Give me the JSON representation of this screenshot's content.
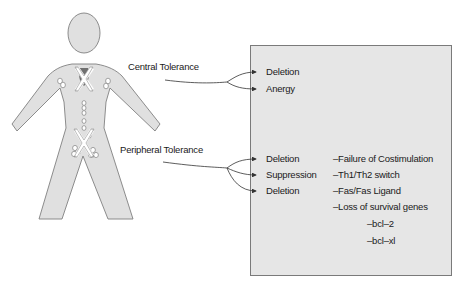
{
  "figure": {
    "body_color": "#e0e0e0",
    "outline_color": "#808080",
    "marker_color": "#ffffff"
  },
  "labels": {
    "central": "Central Tolerance",
    "peripheral": "Peripheral Tolerance"
  },
  "box": {
    "background": "#e6e6e6",
    "central_outcomes": [
      "Deletion",
      "Anergy"
    ],
    "peripheral_outcomes": [
      "Deletion",
      "Suppression",
      "Deletion"
    ],
    "mechanisms": [
      "–Failure of Costimulation",
      "–Th1/Th2 switch",
      "–Fas/Fas Ligand",
      "–Loss of survival genes"
    ],
    "genes": [
      "–bcl–2",
      "–bcl–xl"
    ]
  }
}
